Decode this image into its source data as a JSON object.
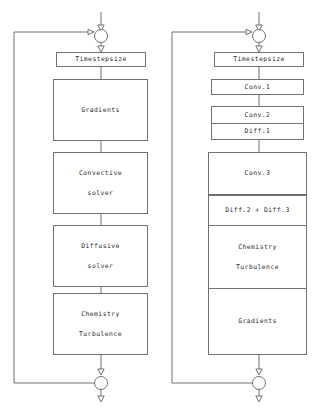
{
  "diagram": {
    "type": "flowchart-pair",
    "stroke_color": "#6f6f6f",
    "background_color": "#ffffff",
    "text_color": "#2a2a2a"
  },
  "left_chart": {
    "name": "left-flowchart",
    "top_junction": "circle-junction",
    "bottom_junction": "circle-junction",
    "feedback_loop": "left-side-return-line",
    "nodes": [
      {
        "id": "timestepsize",
        "lines": [
          "Timestepsize"
        ],
        "style": "narrow"
      },
      {
        "id": "gradients",
        "lines": [
          "Gradients"
        ],
        "style": "wide"
      },
      {
        "id": "convective-solver",
        "lines": [
          "Convective",
          "solver"
        ],
        "style": "wide"
      },
      {
        "id": "diffusive-solver",
        "lines": [
          "Diffusive",
          "solver"
        ],
        "style": "wide"
      },
      {
        "id": "chemistry-turbulence",
        "lines": [
          "Chemistry",
          "Turbulence"
        ],
        "style": "wide"
      }
    ]
  },
  "right_chart": {
    "name": "right-flowchart",
    "top_junction": "circle-junction",
    "bottom_junction": "circle-junction",
    "feedback_loop": "left-side-return-line",
    "nodes": [
      {
        "id": "timestepsize",
        "lines": [
          "Timestepsize"
        ],
        "style": "narrow"
      },
      {
        "id": "conv-1",
        "lines": [
          "Conv.1"
        ],
        "style": "narrow"
      },
      {
        "id": "conv-2",
        "lines": [
          "Conv.2"
        ],
        "style": "narrow-stacked"
      },
      {
        "id": "diff-1",
        "lines": [
          "Diff.1"
        ],
        "style": "narrow-stacked"
      },
      {
        "id": "conv-3",
        "lines": [
          "Conv.3"
        ],
        "style": "wide"
      },
      {
        "id": "diff-2-diff-3",
        "lines": [
          "Diff.2 + Diff.3"
        ],
        "style": "wide-stacked"
      },
      {
        "id": "chemistry-turbulence",
        "lines": [
          "Chemistry",
          "Turbulence"
        ],
        "style": "wide-stacked"
      },
      {
        "id": "gradients",
        "lines": [
          "Gradients"
        ],
        "style": "wide-stacked"
      }
    ]
  }
}
